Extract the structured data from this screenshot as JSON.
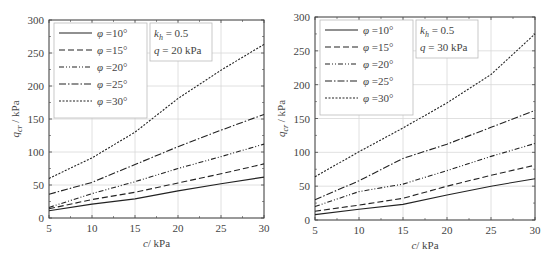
{
  "chart_data": [
    {
      "type": "line",
      "title": "",
      "annotation": [
        "k_h = 0.5",
        "q = 20 kPa"
      ],
      "xlabel": "c/ kPa",
      "ylabel": "q_cr / kPa",
      "xlim": [
        5,
        30
      ],
      "ylim": [
        0,
        300
      ],
      "xticks": [
        5,
        10,
        15,
        20,
        25,
        30
      ],
      "yticks": [
        0,
        50,
        100,
        150,
        200,
        250,
        300
      ],
      "grid": true,
      "legend_position": "upper left",
      "x": [
        5,
        10,
        15,
        20,
        25,
        30
      ],
      "series": [
        {
          "name": "φ =10°",
          "style": "solid",
          "values": [
            11,
            21,
            29,
            41,
            52,
            62
          ]
        },
        {
          "name": "φ =15°",
          "style": "dash",
          "values": [
            14,
            28,
            39,
            53,
            67,
            82
          ]
        },
        {
          "name": "φ =20°",
          "style": "dash-dot-dot",
          "values": [
            16,
            37,
            55,
            75,
            93,
            112
          ]
        },
        {
          "name": "φ =25°",
          "style": "dash-dot",
          "values": [
            36,
            54,
            81,
            108,
            133,
            157
          ]
        },
        {
          "name": "φ =30°",
          "style": "short-dash",
          "values": [
            60,
            91,
            130,
            181,
            224,
            263
          ]
        }
      ]
    },
    {
      "type": "line",
      "title": "",
      "annotation": [
        "k_h = 0.5",
        "q = 30 kPa"
      ],
      "xlabel": "c/ kPa",
      "ylabel": "q_cr / kPa",
      "xlim": [
        5,
        30
      ],
      "ylim": [
        0,
        300
      ],
      "xticks": [
        5,
        10,
        15,
        20,
        25,
        30
      ],
      "yticks": [
        0,
        50,
        100,
        150,
        200,
        250,
        300
      ],
      "grid": true,
      "legend_position": "upper left",
      "x": [
        5,
        10,
        15,
        20,
        25,
        30
      ],
      "series": [
        {
          "name": "φ =10°",
          "style": "solid",
          "values": [
            8,
            16,
            23,
            37,
            50,
            61
          ]
        },
        {
          "name": "φ =15°",
          "style": "dash",
          "values": [
            13,
            22,
            32,
            50,
            66,
            81
          ]
        },
        {
          "name": "φ =20°",
          "style": "dash-dot-dot",
          "values": [
            20,
            42,
            53,
            73,
            94,
            113
          ]
        },
        {
          "name": "φ =25°",
          "style": "dash-dot",
          "values": [
            30,
            58,
            91,
            112,
            137,
            162
          ]
        },
        {
          "name": "φ =30°",
          "style": "short-dash",
          "values": [
            64,
            101,
            136,
            173,
            215,
            275
          ]
        }
      ]
    }
  ],
  "panels": [
    {
      "legend": [
        "φ =10°",
        "φ =15°",
        "φ =20°",
        "φ =25°",
        "φ =30°"
      ],
      "annot_k": "k",
      "annot_k_sub": "h",
      "annot_k_val": " = 0.5",
      "annot_q": "q = 20 kPa",
      "xlabel": "c/ kPa",
      "ylabel_main": "q",
      "ylabel_sub": "cr",
      "ylabel_unit": " / kPa"
    },
    {
      "legend": [
        "φ =10°",
        "φ =15°",
        "φ =20°",
        "φ =25°",
        "φ =30°"
      ],
      "annot_k": "k",
      "annot_k_sub": "h",
      "annot_k_val": " = 0.5",
      "annot_q": "q = 30 kPa",
      "xlabel": "c/ kPa",
      "ylabel_main": "q",
      "ylabel_sub": "cr",
      "ylabel_unit": " / kPa"
    }
  ]
}
